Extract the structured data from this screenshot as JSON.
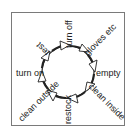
{
  "diagram": {
    "type": "cycle",
    "title": "",
    "steps": [
      {
        "label": "turn off"
      },
      {
        "label": "gloves etc"
      },
      {
        "label": "empty"
      },
      {
        "label": "clean inside"
      },
      {
        "label": "restock"
      },
      {
        "label": "clean outside"
      },
      {
        "label": "turn on"
      },
      {
        "label": "test"
      }
    ],
    "colors": {
      "stroke": "#222222",
      "border": "#7a7a7a",
      "background": "#ffffff"
    }
  }
}
